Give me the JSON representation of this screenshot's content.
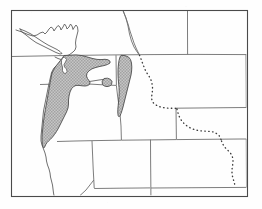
{
  "figure": {
    "type": "distribution-range-map",
    "title": "",
    "caption": "",
    "region_described": "Pacific Northwest and northern Rocky Mountains, western United States and southwestern Canada",
    "width_px": 262,
    "height_px": 209
  },
  "colors": {
    "background": "#fefefe",
    "neatline": "#4a4a4a",
    "state_border": "#6e6e6e",
    "coastline": "#555555",
    "range_fill": "#b6b6b6",
    "range_outline": "#4d4d4d",
    "dotted_line": "#3c3c3c"
  },
  "map": {
    "neatline": {
      "name": "map-frame",
      "x": 11,
      "y": 10,
      "width": 236,
      "height": 186,
      "stroke_width": 1
    },
    "layers": [
      {
        "id": "range-primary",
        "label": "Primary shaded distribution range",
        "symbol": "gray-stipple-fill",
        "areas": [
          "western Washington",
          "western Oregon",
          "northwestern California",
          "southwestern British Columbia"
        ]
      },
      {
        "id": "range-idaho",
        "label": "Northern and central Idaho shaded range",
        "symbol": "gray-stipple-fill",
        "areas": [
          "northern Idaho",
          "central Idaho"
        ]
      },
      {
        "id": "range-outlier",
        "label": "Isolated shaded outlier patch",
        "symbol": "gray-stipple-fill",
        "areas": [
          "Blue Mountains, northeastern Oregon"
        ]
      },
      {
        "id": "dotted-boundary",
        "label": "Dotted boundary line",
        "symbol": "dotted-line",
        "areas": [
          "western Montana",
          "western Wyoming",
          "western Colorado"
        ]
      }
    ],
    "features": {
      "coastline_label": "Pacific coastline",
      "islands_label": "Vancouver Island and coastal islands",
      "state_borders_label": "State and provincial boundaries"
    }
  },
  "chart_data": {
    "type": "map",
    "title": "",
    "xlabel": "",
    "ylabel": "",
    "legend": [],
    "grid": false,
    "projection_note": "unlabeled regional outline map",
    "series": [
      {
        "name": "Shaded distribution range",
        "symbol": "gray stipple polygon",
        "regions": [
          "western Washington",
          "western Oregon",
          "northwestern California",
          "southwestern British Columbia",
          "northern Idaho",
          "central Idaho",
          "Blue Mountains outlier"
        ]
      },
      {
        "name": "Dotted boundary",
        "symbol": "dotted line",
        "regions": [
          "western Montana",
          "western Wyoming",
          "western Colorado"
        ]
      }
    ]
  }
}
